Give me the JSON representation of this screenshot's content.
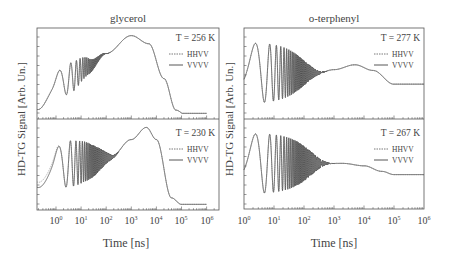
{
  "figure": {
    "columns": [
      {
        "title": "glycerol",
        "ylabel": "HD-TG Signal [Arb. Un.]",
        "xlabel": "Time [ns]",
        "x_ticks": [
          "10^0",
          "10^1",
          "10^2",
          "10^3",
          "10^4",
          "10^5",
          "10^6"
        ],
        "panels": [
          {
            "temperature": "T = 256 K",
            "legend": [
              "HHVV",
              "VVVV"
            ]
          },
          {
            "temperature": "T = 230 K",
            "legend": [
              "HHVV",
              "VVVV"
            ]
          }
        ]
      },
      {
        "title": "o-terphenyl",
        "ylabel": "HD-TG Signal [Arb. Un.]",
        "xlabel": "Time [ns]",
        "x_ticks": [
          "10^0",
          "10^1",
          "10^2",
          "10^3",
          "10^4",
          "10^5",
          "10^6"
        ],
        "panels": [
          {
            "temperature": "T = 277 K",
            "legend": [
              "HHVV",
              "VVVV"
            ]
          },
          {
            "temperature": "T = 267 K",
            "legend": [
              "HHVV",
              "VVVV"
            ]
          }
        ]
      }
    ]
  },
  "chart_data": [
    {
      "type": "line",
      "title": "glycerol",
      "panel": "top",
      "annotation": "T = 256 K",
      "xlabel": "Time [ns]",
      "ylabel": "HD-TG Signal [Arb. Un.]",
      "xscale": "log",
      "xlim": [
        0.18,
        1500000
      ],
      "legend": [
        "HHVV (dotted)",
        "VVVV (solid)"
      ],
      "description": "Damped acoustic oscillations (first peak ~1 ns) superposed on rising thermal signal; maximum near 1e3 ns; decays to baseline by ~1e5 ns",
      "series": [
        {
          "name": "VVVV",
          "x": [
            0.18,
            0.5,
            1.2,
            3,
            6,
            10,
            30,
            100,
            1000,
            5000,
            20000,
            60000,
            150000,
            500000
          ],
          "y": [
            0.25,
            0.45,
            0.62,
            0.3,
            0.55,
            0.52,
            0.62,
            0.78,
            1.0,
            0.88,
            0.45,
            0.06,
            0.0,
            0.0
          ]
        },
        {
          "name": "HHVV",
          "x": [
            0.18,
            0.5,
            1.2,
            3,
            6,
            10,
            30,
            100,
            1000,
            5000,
            20000,
            60000,
            150000,
            500000
          ],
          "y": [
            0.25,
            0.45,
            0.62,
            0.3,
            0.55,
            0.52,
            0.62,
            0.78,
            1.0,
            0.88,
            0.45,
            0.06,
            0.0,
            0.0
          ]
        }
      ]
    },
    {
      "type": "line",
      "title": "glycerol",
      "panel": "bottom",
      "annotation": "T = 230 K",
      "xlabel": "Time [ns]",
      "ylabel": "HD-TG Signal [Arb. Un.]",
      "xscale": "log",
      "xlim": [
        0.18,
        1500000
      ],
      "legend": [
        "HHVV (dotted)",
        "VVVV (solid)"
      ],
      "description": "Strong damped oscillations up to ~1e2 ns, rising to maximum near 4e3 ns, decaying to baseline by ~1e5 ns",
      "series": [
        {
          "name": "VVVV",
          "x": [
            0.18,
            0.5,
            1.2,
            3,
            10,
            100,
            200,
            1000,
            4000,
            10000,
            40000,
            100000,
            700000
          ],
          "y": [
            0.35,
            0.55,
            0.78,
            0.35,
            0.72,
            0.62,
            0.65,
            0.82,
            0.98,
            0.8,
            0.12,
            0.02,
            0.02
          ]
        },
        {
          "name": "HHVV",
          "x": [
            0.18,
            0.5,
            1.2,
            3,
            10,
            100,
            200,
            1000,
            4000,
            10000,
            40000,
            100000,
            700000
          ],
          "y": [
            0.42,
            0.62,
            0.8,
            0.35,
            0.72,
            0.62,
            0.65,
            0.82,
            0.98,
            0.8,
            0.12,
            0.02,
            0.02
          ]
        }
      ]
    },
    {
      "type": "line",
      "title": "o-terphenyl",
      "panel": "top",
      "annotation": "T = 277 K",
      "xlabel": "Time [ns]",
      "ylabel": "HD-TG Signal [Arb. Un.]",
      "xscale": "log",
      "xlim": [
        1,
        1000000
      ],
      "legend": [
        "HHVV (dotted)",
        "VVVV (solid)"
      ],
      "description": "Large damped oscillations damping out by ~3e2 ns, plateau with bump near 5e3 ns, step down near 1e5 ns to flat level",
      "series": [
        {
          "name": "VVVV",
          "x": [
            1,
            2.5,
            10,
            100,
            300,
            1000,
            5000,
            20000,
            100000,
            1000000
          ],
          "y": [
            0.2,
            0.85,
            0.5,
            0.55,
            0.52,
            0.55,
            0.62,
            0.55,
            0.38,
            0.38
          ]
        },
        {
          "name": "HHVV",
          "x": [
            1,
            2.5,
            10,
            100,
            300,
            1000,
            5000,
            20000,
            100000,
            1000000
          ],
          "y": [
            0.2,
            0.85,
            0.5,
            0.55,
            0.52,
            0.55,
            0.62,
            0.55,
            0.38,
            0.38
          ]
        }
      ]
    },
    {
      "type": "line",
      "title": "o-terphenyl",
      "panel": "bottom",
      "annotation": "T = 267 K",
      "xlabel": "Time [ns]",
      "ylabel": "HD-TG Signal [Arb. Un.]",
      "xscale": "log",
      "xlim": [
        1,
        1000000
      ],
      "legend": [
        "HHVV (dotted)",
        "VVVV (solid)"
      ],
      "x_ticks": [
        "10^0",
        "10^1",
        "10^2",
        "10^3",
        "10^4",
        "10^5",
        "10^6"
      ],
      "description": "Large damped oscillations damping out by ~5e2 ns, flat plateau, gentle decrease from ~1e4 to ~1e5 ns then flat",
      "series": [
        {
          "name": "VVVV",
          "x": [
            1,
            2.5,
            10,
            100,
            500,
            1000,
            10000,
            100000,
            1000000
          ],
          "y": [
            0.25,
            0.85,
            0.5,
            0.55,
            0.52,
            0.52,
            0.48,
            0.38,
            0.38
          ]
        },
        {
          "name": "HHVV",
          "x": [
            1,
            2.5,
            10,
            100,
            500,
            1000,
            10000,
            100000,
            1000000
          ],
          "y": [
            0.25,
            0.85,
            0.5,
            0.55,
            0.52,
            0.52,
            0.48,
            0.38,
            0.38
          ]
        }
      ]
    }
  ]
}
